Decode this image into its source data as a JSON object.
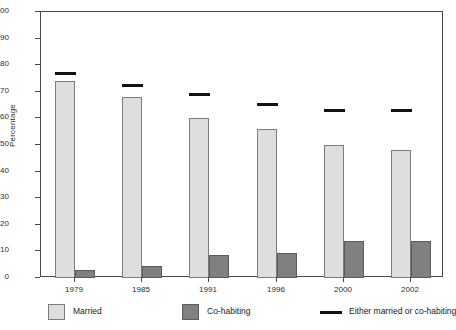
{
  "chart_data": {
    "type": "bar",
    "title": "",
    "xlabel": "",
    "ylabel": "Percentage",
    "ylim": [
      0,
      100
    ],
    "ytick_step": 10,
    "grid": false,
    "legend_position": "bottom",
    "categories": [
      "1979",
      "1985",
      "1991",
      "1996",
      "2000",
      "2002"
    ],
    "yticks": [
      "0",
      "10",
      "20",
      "30",
      "40",
      "50",
      "60",
      "70",
      "80",
      "90",
      "100"
    ],
    "series": [
      {
        "name": "Married",
        "type": "bar",
        "color": "#dedede",
        "values": [
          74,
          68,
          60,
          56,
          50,
          48
        ]
      },
      {
        "name": "Co-habiting",
        "type": "bar",
        "color": "#808080",
        "values": [
          3,
          4.5,
          8.5,
          9.5,
          14,
          14
        ]
      },
      {
        "name": "Either married or co-habiting",
        "type": "marker-line",
        "color": "#111111",
        "values": [
          77,
          72.5,
          69,
          65.5,
          63,
          63
        ]
      }
    ]
  },
  "legend": {
    "items": [
      {
        "label": "Married",
        "swatch": "married-swatch"
      },
      {
        "label": "Co-habiting",
        "swatch": "cohabiting-swatch"
      },
      {
        "label": "Either married or co-habiting",
        "swatch": "marker-line-swatch"
      }
    ]
  }
}
